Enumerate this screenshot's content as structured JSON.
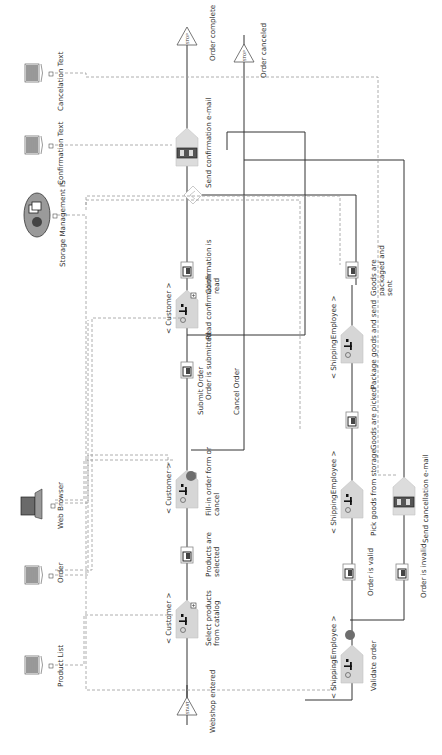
{
  "diagram": {
    "type": "EPC process chain",
    "orientation": "rotated 90 degrees counter-clockwise",
    "events": [
      {
        "id": "e_start",
        "label": "Webshop entered",
        "kind": "start"
      },
      {
        "id": "e_selected",
        "label": "Products are selected"
      },
      {
        "id": "e_submitted",
        "label": "Order is submitted"
      },
      {
        "id": "e_confread",
        "label": "Confirmation is read"
      },
      {
        "id": "e_complete",
        "label": "Order complete",
        "kind": "end"
      },
      {
        "id": "e_canceled",
        "label": "Order canceled",
        "kind": "end"
      },
      {
        "id": "e_valid",
        "label": "Order is valid"
      },
      {
        "id": "e_invalid",
        "label": "Order is invalid"
      },
      {
        "id": "e_picked",
        "label": "Goods are picked"
      },
      {
        "id": "e_packaged",
        "label": "Goods are packaged and sent"
      }
    ],
    "functions": [
      {
        "id": "f_select",
        "label": "Select products from catalog",
        "role": "< Customer >"
      },
      {
        "id": "f_fill",
        "label": "Fill-in order form or cancel",
        "role": "< Customer >"
      },
      {
        "id": "f_read",
        "label": "Read confirmation",
        "role": "< Customer >"
      },
      {
        "id": "f_sendconf",
        "label": "Send confirmation e-mail",
        "role": ""
      },
      {
        "id": "f_validate",
        "label": "Validate order",
        "role": "< ShippingEmployee >"
      },
      {
        "id": "f_pick",
        "label": "Pick goods from storage",
        "role": "< ShippingEmployee >"
      },
      {
        "id": "f_package",
        "label": "Package goods and send",
        "role": "< ShippingEmployee >"
      },
      {
        "id": "f_sendcancel",
        "label": "Send cancellation e-mail",
        "role": ""
      }
    ],
    "branch_labels": {
      "submit": "Submit Order",
      "cancel": "Cancel Order"
    },
    "resources": [
      {
        "id": "r_productlist",
        "label": "Product List",
        "icon": "document-icon"
      },
      {
        "id": "r_order",
        "label": "Order",
        "icon": "document-icon"
      },
      {
        "id": "r_browser",
        "label": "Web Browser",
        "icon": "laptop-icon"
      },
      {
        "id": "r_storage",
        "label": "Storage Management IS",
        "icon": "system-icon"
      },
      {
        "id": "r_conftext",
        "label": "Confirmation Text",
        "icon": "document-icon"
      },
      {
        "id": "r_canceltext",
        "label": "Cancelation Text",
        "icon": "document-icon"
      }
    ],
    "start_marker": "START",
    "end_marker": "STOP",
    "colors": {
      "line": "#333333",
      "dashed": "#9a9a9a",
      "function_fill": "#d6d6d6",
      "xor_circle": "#6e6e6e"
    }
  }
}
